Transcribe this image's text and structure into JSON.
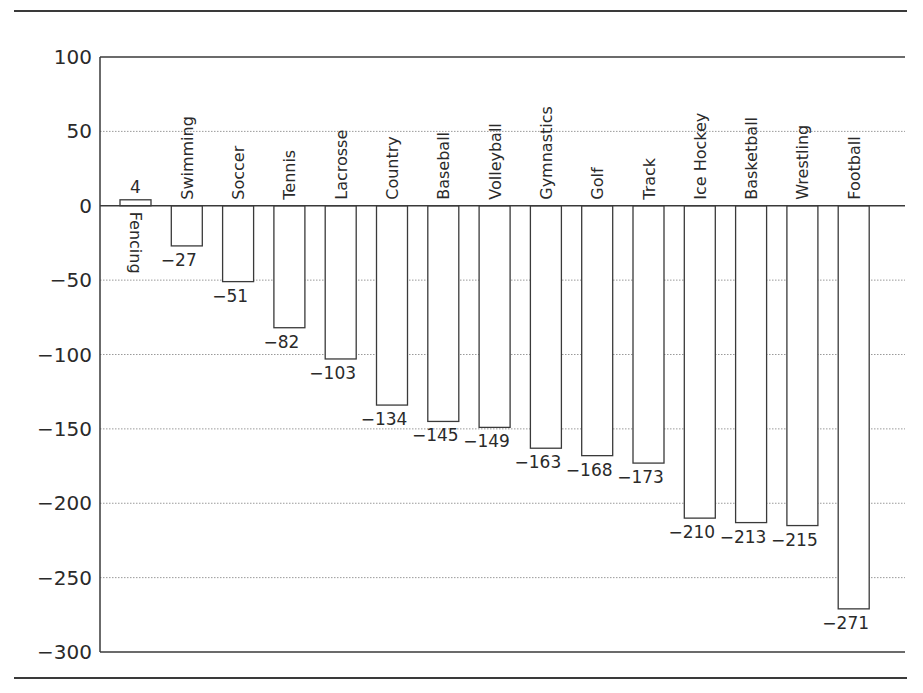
{
  "chart_data": {
    "type": "bar",
    "title": "",
    "xlabel": "",
    "ylabel": "",
    "ylim": [
      -300,
      100
    ],
    "yticks": [
      100,
      50,
      0,
      -50,
      -100,
      -150,
      -200,
      -250,
      -300
    ],
    "grid": "horizontal dotted",
    "legend": null,
    "categories": [
      "Fencing",
      "Swimming",
      "Soccer",
      "Tennis",
      "Lacrosse",
      "Country",
      "Baseball",
      "Volleyball",
      "Gymnastics",
      "Golf",
      "Track",
      "Ice Hockey",
      "Basketball",
      "Wrestling",
      "Football"
    ],
    "values": [
      4,
      -27,
      -51,
      -82,
      -103,
      -134,
      -145,
      -149,
      -163,
      -168,
      -173,
      -210,
      -213,
      -215,
      -271
    ],
    "value_labels": [
      "4",
      "−27",
      "−51",
      "−82",
      "−103",
      "−134",
      "−145",
      "−149",
      "−163",
      "−168",
      "−173",
      "−210",
      "−213",
      "−215",
      "−271"
    ]
  },
  "colors": {
    "bar_fill": "#ffffff",
    "bar_stroke": "#3a3a3a",
    "axis": "#3a3a3a",
    "grid": "#9a9a9a",
    "text": "#2a2a2a"
  }
}
